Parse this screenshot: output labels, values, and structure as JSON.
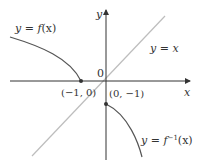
{
  "diagram": {
    "title": "",
    "axes": {
      "x_label": "x",
      "y_label": "y",
      "origin_label": "0"
    },
    "curves": [
      {
        "name": "f",
        "label_prefix": "y = ",
        "label_func": "f",
        "label_arg": "(x)",
        "label_full": "y = f(x)"
      },
      {
        "name": "identity",
        "label_full": "y = x",
        "label_prefix": "y = ",
        "label_var": "x"
      },
      {
        "name": "f_inverse",
        "label_prefix": "y = ",
        "label_func": "f",
        "label_sup": "−1",
        "label_arg": "(x)",
        "label_full": "y = f^{-1}(x)"
      }
    ],
    "points": [
      {
        "label": "(−1, 0)",
        "x": -1,
        "y": 0
      },
      {
        "label": "(0, −1)",
        "x": 0,
        "y": -1
      }
    ],
    "colors": {
      "axis": "#333333",
      "curve": "#555555",
      "identity_line": "#bbbbbb",
      "text": "#333333"
    }
  }
}
